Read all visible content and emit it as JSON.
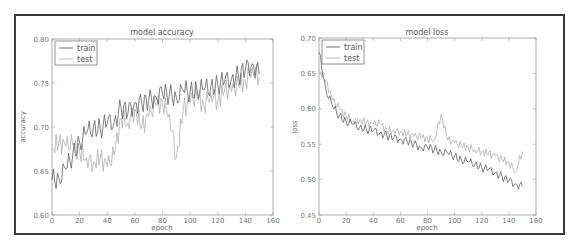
{
  "chart_data": [
    {
      "type": "line",
      "title": "model accuracy",
      "xlabel": "epoch",
      "ylabel": "accuracy",
      "xlim": [
        0,
        160
      ],
      "ylim": [
        0.6,
        0.8
      ],
      "xticks": [
        "0",
        "20",
        "40",
        "60",
        "80",
        "100",
        "120",
        "140",
        "160"
      ],
      "yticks": [
        "0.60",
        "0.65",
        "0.70",
        "0.75",
        "0.80"
      ],
      "grid": false,
      "legend_position": "upper left",
      "x": [
        0,
        5,
        10,
        15,
        20,
        25,
        30,
        35,
        40,
        45,
        50,
        55,
        60,
        65,
        70,
        75,
        80,
        85,
        90,
        95,
        100,
        105,
        110,
        115,
        120,
        125,
        130,
        135,
        140,
        145,
        150
      ],
      "series": [
        {
          "name": "train",
          "color": "#606060",
          "values": [
            0.64,
            0.642,
            0.652,
            0.668,
            0.683,
            0.693,
            0.7,
            0.698,
            0.705,
            0.706,
            0.722,
            0.716,
            0.728,
            0.726,
            0.73,
            0.735,
            0.738,
            0.737,
            0.734,
            0.741,
            0.74,
            0.743,
            0.742,
            0.746,
            0.748,
            0.752,
            0.755,
            0.758,
            0.765,
            0.772,
            0.76
          ]
        },
        {
          "name": "test",
          "color": "#b0b0b0",
          "values": [
            0.675,
            0.683,
            0.678,
            0.68,
            0.672,
            0.665,
            0.66,
            0.665,
            0.655,
            0.668,
            0.71,
            0.705,
            0.72,
            0.7,
            0.712,
            0.725,
            0.728,
            0.715,
            0.665,
            0.72,
            0.728,
            0.735,
            0.725,
            0.738,
            0.73,
            0.742,
            0.74,
            0.748,
            0.752,
            0.768,
            0.757
          ]
        }
      ]
    },
    {
      "type": "line",
      "title": "model loss",
      "xlabel": "epoch",
      "ylabel": "loss",
      "xlim": [
        0,
        160
      ],
      "ylim": [
        0.45,
        0.7
      ],
      "xticks": [
        "0",
        "20",
        "40",
        "60",
        "80",
        "100",
        "120",
        "140",
        "160"
      ],
      "yticks": [
        "0.45",
        "0.50",
        "0.55",
        "0.60",
        "0.65",
        "0.70"
      ],
      "grid": false,
      "legend_position": "upper left",
      "x": [
        0,
        5,
        10,
        15,
        20,
        25,
        30,
        35,
        40,
        45,
        50,
        55,
        60,
        65,
        70,
        75,
        80,
        85,
        90,
        95,
        100,
        105,
        110,
        115,
        120,
        125,
        130,
        135,
        140,
        145,
        150
      ],
      "series": [
        {
          "name": "train",
          "color": "#606060",
          "values": [
            0.68,
            0.628,
            0.603,
            0.59,
            0.582,
            0.578,
            0.574,
            0.571,
            0.569,
            0.566,
            0.562,
            0.559,
            0.557,
            0.554,
            0.55,
            0.546,
            0.545,
            0.543,
            0.539,
            0.537,
            0.533,
            0.528,
            0.525,
            0.522,
            0.517,
            0.514,
            0.51,
            0.504,
            0.498,
            0.494,
            0.49
          ]
        },
        {
          "name": "test",
          "color": "#b0b0b0",
          "values": [
            0.655,
            0.64,
            0.612,
            0.6,
            0.59,
            0.583,
            0.585,
            0.58,
            0.578,
            0.579,
            0.569,
            0.57,
            0.568,
            0.564,
            0.561,
            0.56,
            0.558,
            0.556,
            0.592,
            0.556,
            0.552,
            0.547,
            0.546,
            0.542,
            0.54,
            0.536,
            0.533,
            0.528,
            0.524,
            0.512,
            0.54
          ]
        }
      ]
    }
  ]
}
